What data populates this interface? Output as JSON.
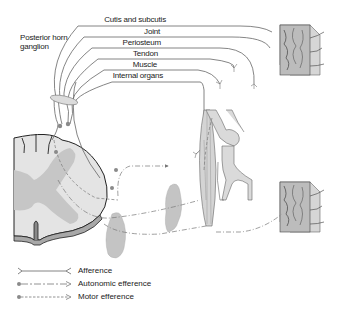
{
  "diagram": {
    "type": "anatomical-schematic",
    "labels": {
      "ganglion": "Posterior horn\nganglion",
      "ganglion_line1": "Posterior horn",
      "ganglion_line2": "ganglion"
    },
    "nerve_targets": [
      {
        "label": "Cutis and subcutis"
      },
      {
        "label": "Joint"
      },
      {
        "label": "Periosteum"
      },
      {
        "label": "Tendon"
      },
      {
        "label": "Muscle"
      },
      {
        "label": "Internal organs"
      }
    ],
    "structures": [
      {
        "name": "spinal-cord-cross-section"
      },
      {
        "name": "skin-tissue-block-upper"
      },
      {
        "name": "skin-tissue-block-lower"
      },
      {
        "name": "knee-joint"
      },
      {
        "name": "muscle"
      },
      {
        "name": "internal-organ-1"
      },
      {
        "name": "internal-organ-2"
      }
    ],
    "colors": {
      "line": "#555555",
      "spinal_gray": "#c8c8c8",
      "spinal_white": "#e6e6e6",
      "organ": "#c4c4c4",
      "dot": "#8a8a8a",
      "ganglion": "#d8d8d8"
    }
  },
  "legend": {
    "items": [
      {
        "label": "Afference",
        "style": "solid-with-fork"
      },
      {
        "label": "Autonomic efference",
        "style": "dash-dot-with-dot"
      },
      {
        "label": "Motor efference",
        "style": "dashed-with-dot"
      }
    ]
  }
}
